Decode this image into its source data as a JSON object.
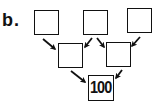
{
  "label": "b.",
  "rows": {
    "top": [
      {
        "value": ""
      },
      {
        "value": ""
      },
      {
        "value": ""
      }
    ],
    "middle": [
      {
        "value": ""
      },
      {
        "value": ""
      }
    ],
    "bottom": [
      {
        "value": "100"
      }
    ]
  },
  "arrows": [
    {
      "from": "top.0",
      "to": "middle.0"
    },
    {
      "from": "top.1",
      "to": "middle.0"
    },
    {
      "from": "top.1",
      "to": "middle.1"
    },
    {
      "from": "top.2",
      "to": "middle.1"
    },
    {
      "from": "middle.0",
      "to": "bottom.0"
    },
    {
      "from": "middle.1",
      "to": "bottom.0"
    }
  ],
  "colors": {
    "stroke": "#111111",
    "background": "#ffffff"
  }
}
